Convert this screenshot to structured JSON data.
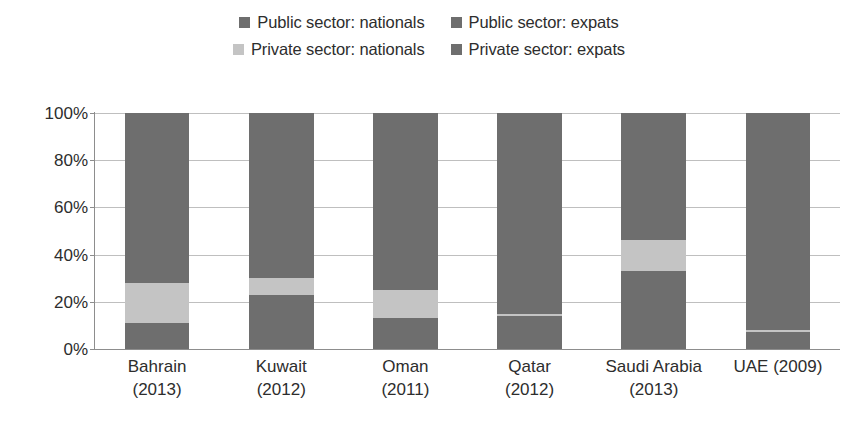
{
  "chart_data": {
    "type": "bar",
    "subtype": "100% stacked bar",
    "title": "",
    "subtitle": "",
    "xlabel": "",
    "ylabel": "",
    "ylim": [
      0,
      100
    ],
    "y_tick_labels": [
      "100%",
      "80%",
      "60%",
      "40%",
      "20%",
      "0%"
    ],
    "y_ticks": [
      100,
      80,
      60,
      40,
      20,
      0
    ],
    "grid": true,
    "legend_position": "top",
    "categories": [
      "Bahrain (2013)",
      "Kuwait (2012)",
      "Oman (2011)",
      "Qatar (2012)",
      "Saudi Arabia (2013)",
      "UAE (2009)"
    ],
    "category_lines": [
      [
        "Bahrain",
        "(2013)"
      ],
      [
        "Kuwait",
        "(2012)"
      ],
      [
        "Oman",
        "(2011)"
      ],
      [
        "Qatar",
        "(2012)"
      ],
      [
        "Saudi Arabia",
        "(2013)"
      ],
      [
        "UAE (2009)",
        ""
      ]
    ],
    "series": [
      {
        "name": "Public sector: nationals",
        "color": "#6e6e6e",
        "values": [
          11,
          23,
          13,
          14,
          33,
          7
        ]
      },
      {
        "name": "Public sector: expats",
        "color": "#6e6e6e",
        "values": [
          0,
          0,
          0,
          0,
          0,
          0
        ]
      },
      {
        "name": "Private sector: nationals",
        "color": "#c4c4c4",
        "values": [
          17,
          7,
          12,
          1,
          13,
          1
        ]
      },
      {
        "name": "Private sector: expats",
        "color": "#6e6e6e",
        "values": [
          72,
          70,
          75,
          85,
          54,
          92
        ]
      }
    ],
    "stack_order_bottom_to_top": [
      "Public sector: nationals",
      "Public sector: expats",
      "Private sector: nationals",
      "Private sector: expats"
    ]
  },
  "legend": {
    "rows": [
      [
        {
          "label": "Public sector: nationals",
          "color": "#6e6e6e"
        },
        {
          "label": "Public sector: expats",
          "color": "#6e6e6e"
        }
      ],
      [
        {
          "label": "Private sector: nationals",
          "color": "#c4c4c4"
        },
        {
          "label": "Private sector: expats",
          "color": "#6e6e6e"
        }
      ]
    ]
  },
  "colors": {
    "dark_gray": "#6e6e6e",
    "light_gray": "#c4c4c4",
    "gridline": "#bfbfbf",
    "axis": "#8d8d8d",
    "text": "#2d2d2d",
    "background": "#ffffff"
  }
}
